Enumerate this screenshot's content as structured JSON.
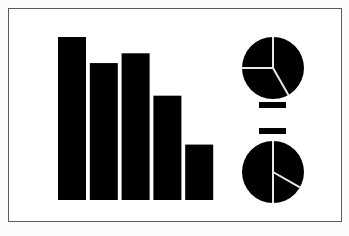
{
  "figure": {
    "ink_color": "#000000",
    "background_color": "#ffffff",
    "border_color": "#5a5a5a"
  },
  "chart_data": [
    {
      "type": "bar",
      "title": "",
      "xlabel": "",
      "ylabel": "",
      "categories": [
        "1",
        "2",
        "3",
        "4",
        "5"
      ],
      "values": [
        100,
        84,
        90,
        64,
        34
      ],
      "ylim": [
        0,
        100
      ],
      "grid": false,
      "note": "relative heights; no axis labels shown"
    },
    {
      "type": "pie",
      "title": "",
      "slices": [
        {
          "label": "A",
          "value": 41.7
        },
        {
          "label": "B",
          "value": 33.3
        },
        {
          "label": "C",
          "value": 25.0
        }
      ]
    },
    {
      "type": "pie",
      "title": "",
      "slices": [
        {
          "label": "A",
          "value": 33.3
        },
        {
          "label": "B",
          "value": 16.7
        },
        {
          "label": "C",
          "value": 50.0
        }
      ]
    }
  ],
  "equals_sign": {
    "symbol": "="
  }
}
